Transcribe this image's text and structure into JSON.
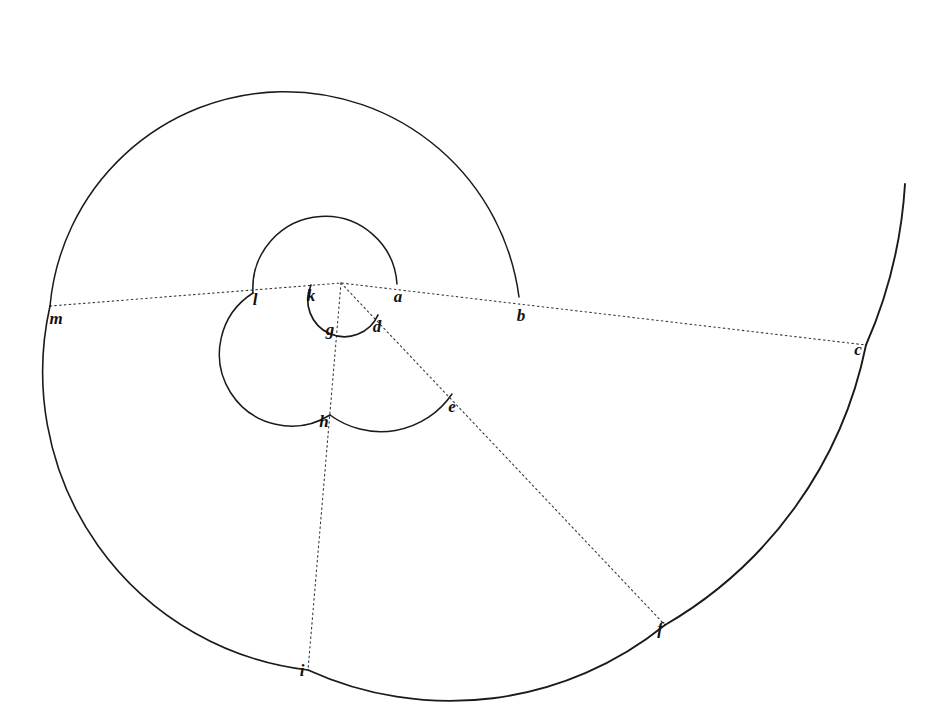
{
  "figure": {
    "kind": "geometric-line-drawing",
    "background_color": "#ffffff",
    "stroke_color": "#1a1a1a",
    "ray_color": "#3a3a3a",
    "canvas": {
      "width": 935,
      "height": 722
    },
    "pole": {
      "x": 341,
      "y": 283
    }
  },
  "labels": [
    {
      "id": "a",
      "text": "a",
      "x": 398,
      "y": 296
    },
    {
      "id": "b",
      "text": "b",
      "x": 521,
      "y": 315
    },
    {
      "id": "c",
      "text": "c",
      "x": 858,
      "y": 349
    },
    {
      "id": "d",
      "text": "d",
      "x": 377,
      "y": 326
    },
    {
      "id": "e",
      "text": "e",
      "x": 452,
      "y": 406
    },
    {
      "id": "f",
      "text": "f",
      "x": 660,
      "y": 628
    },
    {
      "id": "g",
      "text": "g",
      "x": 330,
      "y": 329
    },
    {
      "id": "h",
      "text": "h",
      "x": 324,
      "y": 421
    },
    {
      "id": "i",
      "text": "i",
      "x": 302,
      "y": 670
    },
    {
      "id": "k",
      "text": "k",
      "x": 311,
      "y": 295
    },
    {
      "id": "l",
      "text": "l",
      "x": 255,
      "y": 299
    },
    {
      "id": "m",
      "text": "m",
      "x": 56,
      "y": 318
    }
  ],
  "arcs": [
    {
      "id": "arc-kgd",
      "name": "innermost-arc",
      "d": "M 311 285 A 30 30 0 1 0 378 315",
      "stroke_width": 1.7
    },
    {
      "id": "arc-a-l",
      "name": "second-arc-upper",
      "d": "M 397 284 A 56 56 0 0 0 253 293",
      "stroke_width": 1.5
    },
    {
      "id": "arc-l-h",
      "name": "second-arc-lower-left",
      "d": "M 253 293 A 70 70 0 0 0 330 415",
      "stroke_width": 1.5
    },
    {
      "id": "arc-h-e",
      "name": "second-arc-bottom",
      "d": "M 330 415 A 86 86 0 0 0 452 394",
      "stroke_width": 1.5
    },
    {
      "id": "arc-b-m",
      "name": "third-arc-upper-left",
      "d": "M 519 297 A 236 236 0 0 0 50 306",
      "stroke_width": 1.5
    },
    {
      "id": "arc-m-i",
      "name": "third-arc-lower-left",
      "d": "M 50 306 A 300 300 0 0 0 308 670",
      "stroke_width": 1.6
    },
    {
      "id": "arc-i-f",
      "name": "third-arc-bottom-right",
      "d": "M 308 670 A 342 342 0 0 0 665 625",
      "stroke_width": 1.8
    },
    {
      "id": "arc-f-c",
      "name": "outer-arc-right",
      "d": "M 665 625 A 420 420 0 0 0 866 345",
      "stroke_width": 1.9
    },
    {
      "id": "arc-c-top",
      "name": "outermost-arc-tail",
      "d": "M 866 345 A 470 470 0 0 0 905 184",
      "stroke_width": 1.9
    }
  ],
  "rays": [
    {
      "id": "ray-horizontal",
      "name": "ray-to-m-and-c",
      "d": "M 50 306 L 341 283 L 866 345"
    },
    {
      "id": "ray-diagonal",
      "name": "ray-to-f",
      "d": "M 341 283 L 665 625"
    },
    {
      "id": "ray-vertical",
      "name": "ray-to-i",
      "d": "M 341 283 L 308 670"
    }
  ]
}
